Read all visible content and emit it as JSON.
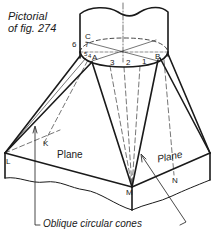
{
  "figure": {
    "title_line1": "Pictorial",
    "title_line2": "of fig. 274",
    "caption": "Oblique circular cones",
    "colors": {
      "ink": "#1a1a1a",
      "paper": "#ffffff"
    }
  },
  "labels": {
    "C": "C",
    "six": "6",
    "seven": "7",
    "five": "5",
    "four": "4",
    "A": "A",
    "three": "3",
    "two": "2",
    "one": "1",
    "B": "B",
    "K": "K",
    "L": "L",
    "M": "M",
    "N": "N",
    "plane_left": "Plane",
    "plane_right": "Plane"
  }
}
